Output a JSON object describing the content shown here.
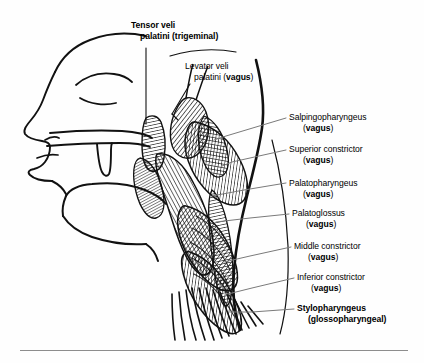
{
  "figure": {
    "background_color": "#fefefe",
    "ink_color": "#000000",
    "leader_color": "#7a7a7a",
    "rule_color": "#8d8d8d"
  },
  "labels": [
    {
      "id": "tensor-veli-palatini",
      "line1": "Tensor veli",
      "line2": "palatini (trigeminal)",
      "muscle": "Tensor veli palatini",
      "nerve": "trigeminal",
      "bold": true,
      "x": 131,
      "y": 20
    },
    {
      "id": "levator-veli-palatini",
      "line1": "Levator veli",
      "line2_pre": "palatini (",
      "nerve": "vagus",
      "line2_post": ")",
      "muscle": "Levator veli palatini",
      "bold": false,
      "x": 185,
      "y": 61
    },
    {
      "id": "salpingopharyngeus",
      "line1": "Salpingopharyngeus",
      "line2_pre": "(",
      "nerve": "vagus",
      "line2_post": ")",
      "muscle": "Salpingopharyngeus",
      "bold": false,
      "x": 289,
      "y": 112
    },
    {
      "id": "superior-constrictor",
      "line1": "Superior constrictor",
      "line2_pre": "(",
      "nerve": "vagus",
      "line2_post": ")",
      "muscle": "Superior constrictor",
      "bold": false,
      "x": 289,
      "y": 144
    },
    {
      "id": "palatopharyngeus",
      "line1": "Palatopharyngeus",
      "line2_pre": "(",
      "nerve": "vagus",
      "line2_post": ")",
      "muscle": "Palatopharyngeus",
      "bold": false,
      "x": 289,
      "y": 178
    },
    {
      "id": "palatoglossus",
      "line1": "Palatoglossus",
      "line2_pre": "(",
      "nerve": "vagus",
      "line2_post": ")",
      "muscle": "Palatoglossus",
      "bold": false,
      "x": 292,
      "y": 208
    },
    {
      "id": "middle-constrictor",
      "line1": "Middle constrictor",
      "line2_pre": "(",
      "nerve": "vagus",
      "line2_post": ")",
      "muscle": "Middle constrictor",
      "bold": false,
      "x": 294,
      "y": 241
    },
    {
      "id": "inferior-constrictor",
      "line1": "Inferior constrictor",
      "line2_pre": "(",
      "nerve": "vagus",
      "line2_post": ")",
      "muscle": "Inferior constrictor",
      "bold": false,
      "x": 297,
      "y": 272
    },
    {
      "id": "stylopharyngeus",
      "line1": "Stylopharyngeus",
      "line2_pre": "(",
      "nerve": "glossopharyngeal",
      "line2_post": ")",
      "muscle": "Stylopharyngeus",
      "bold": true,
      "x": 297,
      "y": 303
    }
  ],
  "anatomy": {
    "structures": [
      "head-profile-outline",
      "nose",
      "closed-eye",
      "eyebrow",
      "lips",
      "hard-palate",
      "soft-palate-uvula",
      "tongue",
      "mandible",
      "posterior-pharyngeal-wall",
      "pharyngeal-muscle-hatching"
    ]
  }
}
